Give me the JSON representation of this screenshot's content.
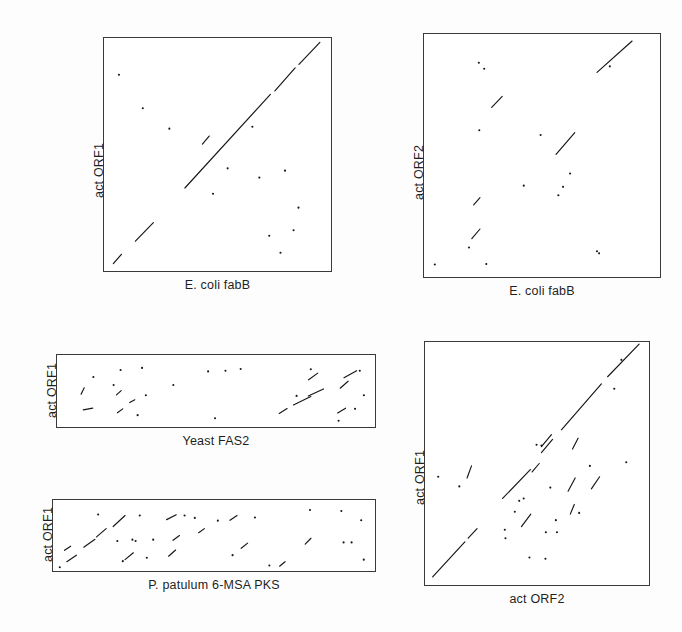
{
  "figure": {
    "background_color": "#fdfdfd",
    "axis_color": "#3a3a3a",
    "point_color": "#161616"
  },
  "panels": [
    {
      "id": "act-orf1-vs-ecoli-fabb",
      "xlabel": "E. coli fabB",
      "ylabel": "act ORF1",
      "rect": {
        "x": 103,
        "y": 37,
        "w": 229,
        "h": 235
      },
      "xlabel_y": 278,
      "ylabel_x": 92,
      "ylabel_y": 198
    },
    {
      "id": "act-orf2-vs-ecoli-fabb",
      "xlabel": "E. coli fabB",
      "ylabel": "act ORF2",
      "rect": {
        "x": 423,
        "y": 33,
        "w": 238,
        "h": 245
      },
      "xlabel_y": 284,
      "ylabel_x": 412,
      "ylabel_y": 200
    },
    {
      "id": "act-orf1-vs-yeast-fas2",
      "xlabel": "Yeast FAS2",
      "ylabel": "act ORF1",
      "rect": {
        "x": 56,
        "y": 354,
        "w": 320,
        "h": 74
      },
      "xlabel_y": 434,
      "ylabel_x": 45,
      "ylabel_y": 418
    },
    {
      "id": "act-orf1-vs-ppatulum-6msa-pks",
      "xlabel": "P. patulum 6-MSA PKS",
      "ylabel": "act ORF1",
      "rect": {
        "x": 52,
        "y": 499,
        "w": 324,
        "h": 73
      },
      "xlabel_y": 578,
      "ylabel_x": 41,
      "ylabel_y": 562
    },
    {
      "id": "act-orf1-vs-act-orf2",
      "xlabel": "act ORF2",
      "ylabel": "act ORF1",
      "rect": {
        "x": 424,
        "y": 341,
        "w": 226,
        "h": 245
      },
      "xlabel_y": 592,
      "ylabel_x": 413,
      "ylabel_y": 505
    }
  ],
  "chart_data": [
    {
      "type": "scatter",
      "id": "act-orf1-vs-ecoli-fabb",
      "title": "",
      "xlabel": "E. coli fabB",
      "ylabel": "act ORF1",
      "xlim": [
        0,
        1
      ],
      "ylim": [
        0,
        1
      ],
      "grid": false,
      "legend": "none",
      "description": "Dot-matrix (dot plot) sequence comparison; strong continuous main diagonal in the upper-right two thirds plus a short offset diagonal at lower left and scattered noise dots.",
      "segments": [
        {
          "x1": 0.355,
          "y1": 0.355,
          "x2": 0.735,
          "y2": 0.76
        },
        {
          "x1": 0.755,
          "y1": 0.775,
          "x2": 0.845,
          "y2": 0.875
        },
        {
          "x1": 0.862,
          "y1": 0.89,
          "x2": 0.955,
          "y2": 0.985
        },
        {
          "x1": 0.135,
          "y1": 0.125,
          "x2": 0.215,
          "y2": 0.205
        },
        {
          "x1": 0.037,
          "y1": 0.028,
          "x2": 0.073,
          "y2": 0.068
        },
        {
          "x1": 0.433,
          "y1": 0.545,
          "x2": 0.463,
          "y2": 0.58
        }
      ],
      "points": [
        {
          "x": 0.062,
          "y": 0.845
        },
        {
          "x": 0.286,
          "y": 0.612
        },
        {
          "x": 0.655,
          "y": 0.62
        },
        {
          "x": 0.545,
          "y": 0.44
        },
        {
          "x": 0.686,
          "y": 0.4
        },
        {
          "x": 0.8,
          "y": 0.43
        },
        {
          "x": 0.86,
          "y": 0.27
        },
        {
          "x": 0.838,
          "y": 0.172
        },
        {
          "x": 0.73,
          "y": 0.148
        },
        {
          "x": 0.78,
          "y": 0.075
        },
        {
          "x": 0.168,
          "y": 0.7
        },
        {
          "x": 0.48,
          "y": 0.33
        }
      ]
    },
    {
      "type": "scatter",
      "id": "act-orf2-vs-ecoli-fabb",
      "title": "",
      "xlabel": "E. coli fabB",
      "ylabel": "act ORF2",
      "xlim": [
        0,
        1
      ],
      "ylim": [
        0,
        1
      ],
      "grid": false,
      "legend": "none",
      "description": "Dot-matrix comparison with two short diagonal segments (one upper right, one centre) and widely scattered dots; no continuous full-length diagonal.",
      "segments": [
        {
          "x1": 0.735,
          "y1": 0.845,
          "x2": 0.885,
          "y2": 0.975
        },
        {
          "x1": 0.56,
          "y1": 0.505,
          "x2": 0.64,
          "y2": 0.595
        },
        {
          "x1": 0.285,
          "y1": 0.7,
          "x2": 0.33,
          "y2": 0.745
        },
        {
          "x1": 0.208,
          "y1": 0.295,
          "x2": 0.235,
          "y2": 0.325
        },
        {
          "x1": 0.2,
          "y1": 0.155,
          "x2": 0.235,
          "y2": 0.195
        }
      ],
      "points": [
        {
          "x": 0.23,
          "y": 0.885
        },
        {
          "x": 0.253,
          "y": 0.86
        },
        {
          "x": 0.79,
          "y": 0.87
        },
        {
          "x": 0.232,
          "y": 0.605
        },
        {
          "x": 0.494,
          "y": 0.585
        },
        {
          "x": 0.62,
          "y": 0.425
        },
        {
          "x": 0.59,
          "y": 0.37
        },
        {
          "x": 0.57,
          "y": 0.335
        },
        {
          "x": 0.422,
          "y": 0.375
        },
        {
          "x": 0.188,
          "y": 0.118
        },
        {
          "x": 0.042,
          "y": 0.048
        },
        {
          "x": 0.262,
          "y": 0.05
        },
        {
          "x": 0.735,
          "y": 0.103
        },
        {
          "x": 0.744,
          "y": 0.094
        }
      ]
    },
    {
      "type": "scatter",
      "id": "act-orf1-vs-yeast-fas2",
      "title": "",
      "xlabel": "Yeast FAS2",
      "ylabel": "act ORF1",
      "xlim": [
        0,
        1
      ],
      "ylim": [
        0,
        1
      ],
      "grid": false,
      "legend": "none",
      "description": "Wide dot-matrix panel: dense cluster of short diagonals at the left edge, a second run of short diagonals in the right third, otherwise sparse noise.",
      "segments": [
        {
          "x1": 0.073,
          "y1": 0.455,
          "x2": 0.083,
          "y2": 0.545
        },
        {
          "x1": 0.08,
          "y1": 0.23,
          "x2": 0.11,
          "y2": 0.255
        },
        {
          "x1": 0.185,
          "y1": 0.445,
          "x2": 0.2,
          "y2": 0.505
        },
        {
          "x1": 0.188,
          "y1": 0.19,
          "x2": 0.205,
          "y2": 0.245
        },
        {
          "x1": 0.227,
          "y1": 0.335,
          "x2": 0.243,
          "y2": 0.375
        },
        {
          "x1": 0.745,
          "y1": 0.3,
          "x2": 0.8,
          "y2": 0.42
        },
        {
          "x1": 0.792,
          "y1": 0.43,
          "x2": 0.84,
          "y2": 0.53
        },
        {
          "x1": 0.793,
          "y1": 0.66,
          "x2": 0.822,
          "y2": 0.755
        },
        {
          "x1": 0.893,
          "y1": 0.54,
          "x2": 0.918,
          "y2": 0.64
        },
        {
          "x1": 0.905,
          "y1": 0.69,
          "x2": 0.945,
          "y2": 0.79
        },
        {
          "x1": 0.7,
          "y1": 0.18,
          "x2": 0.725,
          "y2": 0.25
        },
        {
          "x1": 0.885,
          "y1": 0.185,
          "x2": 0.91,
          "y2": 0.255
        }
      ],
      "points": [
        {
          "x": 0.112,
          "y": 0.7
        },
        {
          "x": 0.198,
          "y": 0.8
        },
        {
          "x": 0.266,
          "y": 0.83
        },
        {
          "x": 0.176,
          "y": 0.585
        },
        {
          "x": 0.278,
          "y": 0.44
        },
        {
          "x": 0.365,
          "y": 0.585
        },
        {
          "x": 0.475,
          "y": 0.78
        },
        {
          "x": 0.53,
          "y": 0.79
        },
        {
          "x": 0.578,
          "y": 0.815
        },
        {
          "x": 0.8,
          "y": 0.81
        },
        {
          "x": 0.955,
          "y": 0.79
        },
        {
          "x": 0.968,
          "y": 0.44
        },
        {
          "x": 0.94,
          "y": 0.245
        },
        {
          "x": 0.888,
          "y": 0.075
        },
        {
          "x": 0.497,
          "y": 0.11
        },
        {
          "x": 0.252,
          "y": 0.155
        },
        {
          "x": 0.755,
          "y": 0.43
        }
      ]
    },
    {
      "type": "scatter",
      "id": "act-orf1-vs-ppatulum-6msa-pks",
      "title": "",
      "xlabel": "P. patulum 6-MSA PKS",
      "ylabel": "act ORF1",
      "xlim": [
        0,
        1
      ],
      "ylim": [
        0,
        1
      ],
      "grid": false,
      "legend": "none",
      "description": "Wide dot-matrix panel: a broken diagonal run in the left quarter indicating local homology, with scattered dots and very short diagonals across the remainder.",
      "segments": [
        {
          "x1": 0.04,
          "y1": 0.12,
          "x2": 0.07,
          "y2": 0.215
        },
        {
          "x1": 0.093,
          "y1": 0.33,
          "x2": 0.128,
          "y2": 0.445
        },
        {
          "x1": 0.133,
          "y1": 0.48,
          "x2": 0.163,
          "y2": 0.6
        },
        {
          "x1": 0.185,
          "y1": 0.63,
          "x2": 0.222,
          "y2": 0.79
        },
        {
          "x1": 0.222,
          "y1": 0.15,
          "x2": 0.248,
          "y2": 0.25
        },
        {
          "x1": 0.033,
          "y1": 0.285,
          "x2": 0.052,
          "y2": 0.345
        },
        {
          "x1": 0.358,
          "y1": 0.2,
          "x2": 0.38,
          "y2": 0.29
        },
        {
          "x1": 0.372,
          "y1": 0.43,
          "x2": 0.392,
          "y2": 0.5
        },
        {
          "x1": 0.452,
          "y1": 0.54,
          "x2": 0.47,
          "y2": 0.6
        },
        {
          "x1": 0.585,
          "y1": 0.315,
          "x2": 0.605,
          "y2": 0.39
        },
        {
          "x1": 0.705,
          "y1": 0.055,
          "x2": 0.722,
          "y2": 0.12
        },
        {
          "x1": 0.785,
          "y1": 0.375,
          "x2": 0.803,
          "y2": 0.46
        },
        {
          "x1": 0.352,
          "y1": 0.73,
          "x2": 0.382,
          "y2": 0.8
        },
        {
          "x1": 0.55,
          "y1": 0.72,
          "x2": 0.572,
          "y2": 0.79
        }
      ],
      "points": [
        {
          "x": 0.138,
          "y": 0.805
        },
        {
          "x": 0.268,
          "y": 0.79
        },
        {
          "x": 0.408,
          "y": 0.79
        },
        {
          "x": 0.44,
          "y": 0.755
        },
        {
          "x": 0.512,
          "y": 0.715
        },
        {
          "x": 0.628,
          "y": 0.76
        },
        {
          "x": 0.8,
          "y": 0.87
        },
        {
          "x": 0.898,
          "y": 0.855
        },
        {
          "x": 0.96,
          "y": 0.72
        },
        {
          "x": 0.905,
          "y": 0.4
        },
        {
          "x": 0.93,
          "y": 0.4
        },
        {
          "x": 0.968,
          "y": 0.15
        },
        {
          "x": 0.558,
          "y": 0.215
        },
        {
          "x": 0.673,
          "y": 0.065
        },
        {
          "x": 0.29,
          "y": 0.178
        },
        {
          "x": 0.215,
          "y": 0.128
        },
        {
          "x": 0.198,
          "y": 0.42
        },
        {
          "x": 0.245,
          "y": 0.44
        },
        {
          "x": 0.255,
          "y": 0.42
        },
        {
          "x": 0.018,
          "y": 0.04
        },
        {
          "x": 0.31,
          "y": 0.44
        }
      ]
    },
    {
      "type": "scatter",
      "id": "act-orf1-vs-act-orf2",
      "title": "",
      "xlabel": "act ORF2",
      "ylabel": "act ORF1",
      "xlim": [
        0,
        1
      ],
      "ylim": [
        0,
        1
      ],
      "grid": false,
      "legend": "none",
      "description": "Dot-matrix self/paralogue comparison: a broken but clearly traceable main diagonal from lower-left to upper-right, plus several parallel off-diagonal segments indicating repeated domains.",
      "segments": [
        {
          "x1": 0.03,
          "y1": 0.03,
          "x2": 0.175,
          "y2": 0.175
        },
        {
          "x1": 0.19,
          "y1": 0.19,
          "x2": 0.23,
          "y2": 0.23
        },
        {
          "x1": 0.345,
          "y1": 0.355,
          "x2": 0.47,
          "y2": 0.475
        },
        {
          "x1": 0.52,
          "y1": 0.545,
          "x2": 0.57,
          "y2": 0.6
        },
        {
          "x1": 0.52,
          "y1": 0.57,
          "x2": 0.565,
          "y2": 0.62
        },
        {
          "x1": 0.61,
          "y1": 0.64,
          "x2": 0.79,
          "y2": 0.83
        },
        {
          "x1": 0.818,
          "y1": 0.86,
          "x2": 0.96,
          "y2": 0.995
        },
        {
          "x1": 0.43,
          "y1": 0.238,
          "x2": 0.472,
          "y2": 0.29
        },
        {
          "x1": 0.478,
          "y1": 0.465,
          "x2": 0.51,
          "y2": 0.5
        },
        {
          "x1": 0.64,
          "y1": 0.385,
          "x2": 0.672,
          "y2": 0.44
        },
        {
          "x1": 0.745,
          "y1": 0.395,
          "x2": 0.782,
          "y2": 0.445
        },
        {
          "x1": 0.185,
          "y1": 0.44,
          "x2": 0.205,
          "y2": 0.49
        },
        {
          "x1": 0.66,
          "y1": 0.56,
          "x2": 0.685,
          "y2": 0.605
        },
        {
          "x1": 0.65,
          "y1": 0.29,
          "x2": 0.668,
          "y2": 0.33
        }
      ],
      "points": [
        {
          "x": 0.055,
          "y": 0.445
        },
        {
          "x": 0.15,
          "y": 0.405
        },
        {
          "x": 0.44,
          "y": 0.355
        },
        {
          "x": 0.4,
          "y": 0.3
        },
        {
          "x": 0.42,
          "y": 0.345
        },
        {
          "x": 0.355,
          "y": 0.225
        },
        {
          "x": 0.358,
          "y": 0.19
        },
        {
          "x": 0.54,
          "y": 0.215
        },
        {
          "x": 0.466,
          "y": 0.11
        },
        {
          "x": 0.538,
          "y": 0.105
        },
        {
          "x": 0.59,
          "y": 0.215
        },
        {
          "x": 0.585,
          "y": 0.265
        },
        {
          "x": 0.69,
          "y": 0.295
        },
        {
          "x": 0.738,
          "y": 0.49
        },
        {
          "x": 0.902,
          "y": 0.505
        },
        {
          "x": 0.848,
          "y": 0.81
        },
        {
          "x": 0.88,
          "y": 0.93
        },
        {
          "x": 0.52,
          "y": 0.575
        },
        {
          "x": 0.498,
          "y": 0.578
        },
        {
          "x": 0.56,
          "y": 0.4
        }
      ]
    }
  ]
}
